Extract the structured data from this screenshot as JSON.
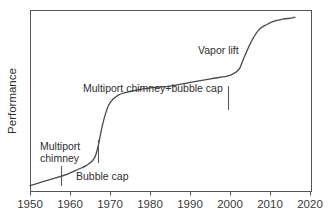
{
  "chart_data": {
    "type": "line",
    "title": "",
    "subtitle": "",
    "xlabel": "",
    "ylabel": "Performance",
    "xlim": [
      1950,
      2020
    ],
    "ylim": [
      0,
      100
    ],
    "grid": false,
    "legend": "none",
    "x_ticks": [
      "1950",
      "1960",
      "1970",
      "1980",
      "1990",
      "2000",
      "2010",
      "2020"
    ],
    "x_tick_values": [
      1950,
      1960,
      1970,
      1980,
      1990,
      2000,
      2010,
      2020
    ],
    "y_ticks": [],
    "y_tick_values": [],
    "series": [
      {
        "name": "Performance",
        "x": [
          1950,
          1953,
          1956,
          1959,
          1962,
          1964,
          1966,
          1967,
          1968,
          1969,
          1970,
          1972,
          1975,
          1980,
          1985,
          1990,
          1995,
          1998,
          2000,
          2002,
          2003,
          2005,
          2007,
          2009,
          2011,
          2013,
          2015,
          2016
        ],
        "values": [
          3,
          5,
          7,
          9,
          12,
          14,
          18,
          25,
          36,
          44,
          49,
          53,
          55,
          57,
          58,
          60,
          62,
          63,
          64,
          67,
          72,
          82,
          89,
          92,
          94,
          95,
          95.5,
          96
        ]
      }
    ],
    "annotations": [
      {
        "label": "Multiport chimney",
        "lines": [
          "Multiport",
          "chimney"
        ],
        "x_value": 1957.8,
        "marker": "vertical-tick"
      },
      {
        "label": "Bubble cap",
        "lines": [
          "Bubble cap"
        ],
        "x_value": 1967.0,
        "marker": "vertical-tick"
      },
      {
        "label": "Multiport chimney+bubble cap",
        "lines": [
          "Multiport chimney+bubble cap"
        ],
        "x_value": 1999.0,
        "marker": "vertical-tick"
      },
      {
        "label": "Vapor lift",
        "lines": [
          "Vapor lift"
        ],
        "x_value": 2004.0,
        "marker": "none"
      }
    ]
  },
  "axis": {
    "y_title": "Performance",
    "x_tick_1": "1950",
    "x_tick_2": "1960",
    "x_tick_3": "1970",
    "x_tick_4": "1980",
    "x_tick_5": "1990",
    "x_tick_6": "2000",
    "x_tick_7": "2010",
    "x_tick_8": "2020"
  },
  "annotations": {
    "multiport_chimney_line1": "Multiport",
    "multiport_chimney_line2": "chimney",
    "bubble_cap": "Bubble cap",
    "multiport_bubble": "Multiport chimney+bubble cap",
    "vapor_lift": "Vapor lift"
  },
  "colors": {
    "curve": "#4a4a4a",
    "axis": "#555555",
    "text": "#2e2e2e",
    "background": "#ffffff"
  }
}
